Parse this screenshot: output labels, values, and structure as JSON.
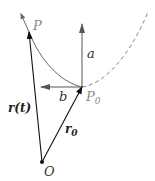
{
  "diagram": {
    "labels": {
      "P": "P",
      "P0": "P",
      "P0_sub": "0",
      "a": "a",
      "b": "b",
      "r_t": "r(t)",
      "r0": "r",
      "r0_sub": "0",
      "O": "O"
    },
    "points": {
      "O": [
        42,
        162
      ],
      "P0": [
        82,
        87
      ],
      "P": [
        29,
        32
      ],
      "curve_tip": [
        21,
        14
      ]
    },
    "vectors": [
      {
        "name": "r(t)",
        "from": "O",
        "to": "P",
        "style": "solid-black"
      },
      {
        "name": "r0",
        "from": "O",
        "to": "P0",
        "style": "solid-black"
      },
      {
        "name": "a",
        "from": "P0",
        "to": [
          82,
          24
        ],
        "style": "solid-grey"
      },
      {
        "name": "b",
        "from": "P0",
        "to": [
          41,
          87
        ],
        "style": "solid-grey"
      }
    ],
    "curve": {
      "solid_segment": "P to P0",
      "dashed_segment": "P0 to upper right",
      "color": "#777777"
    }
  }
}
